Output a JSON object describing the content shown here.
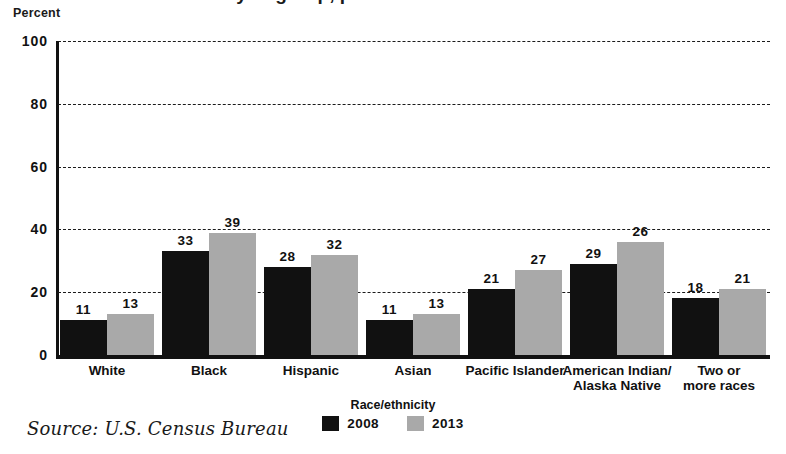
{
  "title_partial": "Race/ethnicity of group, percent",
  "axis": {
    "ylabel": "Percent",
    "yticks": [
      "0",
      "20",
      "40",
      "60",
      "80",
      "100"
    ]
  },
  "legend": {
    "title": "Race/ethnicity",
    "items": [
      {
        "label": "2008",
        "color": "#111111"
      },
      {
        "label": "2013",
        "color": "#a9a9a9"
      }
    ]
  },
  "source": "Source: U.S. Census Bureau",
  "chart_data": {
    "type": "bar",
    "title": "",
    "xlabel": "Race/ethnicity",
    "ylabel": "Percent",
    "ylim": [
      0,
      100
    ],
    "ytick_step": 20,
    "grid": true,
    "legend_position": "bottom-center",
    "categories": [
      "White",
      "Black",
      "Hispanic",
      "Asian",
      "Pacific Islander",
      "American Indian/\nAlaska Native",
      "Two or\nmore races"
    ],
    "category_lines": [
      [
        "White"
      ],
      [
        "Black"
      ],
      [
        "Hispanic"
      ],
      [
        "Asian"
      ],
      [
        "Pacific Islander"
      ],
      [
        "American Indian/",
        "Alaska Native"
      ],
      [
        "Two or",
        "more races"
      ]
    ],
    "series": [
      {
        "name": "2008",
        "color": "#111111",
        "values": [
          11,
          33,
          28,
          11,
          21,
          29,
          18
        ]
      },
      {
        "name": "2013",
        "color": "#a9a9a9",
        "values": [
          13,
          39,
          32,
          13,
          27,
          26,
          21
        ],
        "plotted_heights": [
          13,
          39,
          32,
          13,
          27,
          36,
          21
        ]
      }
    ]
  }
}
